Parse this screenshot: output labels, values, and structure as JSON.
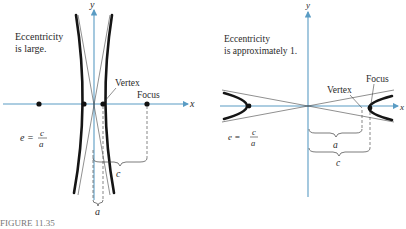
{
  "figure": {
    "caption": "FIGURE 11.35",
    "colors": {
      "axis": "#5a9cc4",
      "curve": "#151515",
      "text": "#2a2a2a"
    }
  },
  "left_panel": {
    "note_line1": "Eccentricity",
    "note_line2": "is large.",
    "axis_x": "x",
    "axis_y": "y",
    "vertex_label": "Vertex",
    "focus_label": "Focus",
    "formula_lhs": "e =",
    "formula_num": "c",
    "formula_den": "a",
    "brace_c": "c",
    "brace_a": "a"
  },
  "right_panel": {
    "note_line1": "Eccentricity",
    "note_line2": "is approximately 1.",
    "axis_x": "x",
    "axis_y": "y",
    "vertex_label": "Vertex",
    "focus_label": "Focus",
    "formula_lhs": "e =",
    "formula_num": "c",
    "formula_den": "a",
    "brace_a": "a",
    "brace_c": "c"
  }
}
